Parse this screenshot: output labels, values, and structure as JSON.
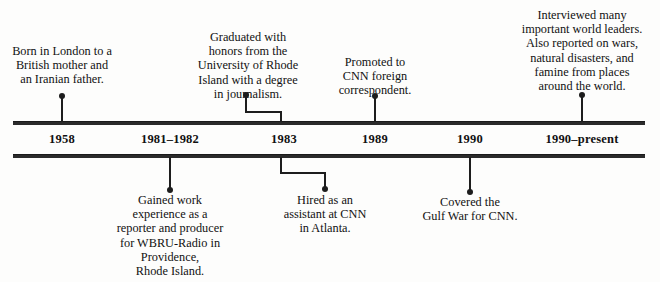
{
  "figure": {
    "type": "timeline",
    "orientation": "horizontal",
    "axis": {
      "line_color": "#2b2b2b",
      "style": "double-rule-band",
      "left_px": 13,
      "right_px": 645,
      "top_rule_y": 121,
      "bottom_rule_y": 154
    },
    "background_color": "#fdfdfc",
    "text_color": "#111111"
  },
  "years": [
    {
      "label": "1958",
      "x": 62
    },
    {
      "label": "1981–1982",
      "x": 170
    },
    {
      "label": "1983",
      "x": 284
    },
    {
      "label": "1989",
      "x": 375
    },
    {
      "label": "1990",
      "x": 470
    },
    {
      "label": "1990–present",
      "x": 582
    }
  ],
  "events": [
    {
      "id": "born",
      "year": "1958",
      "side": "above",
      "text": "Born in London to a\nBritish mother and\nan Iranian father.",
      "caption_x": 62,
      "caption_top": 44,
      "caption_width": 124,
      "dot_x": 62,
      "dot_y": 96,
      "connector": "straight"
    },
    {
      "id": "graduated",
      "year": "1983",
      "side": "above",
      "text": "Graduated with\nhonors from the\nUniversity of Rhode\nIsland with a degree\nin journalism.",
      "caption_x": 248,
      "caption_top": 30,
      "caption_width": 132,
      "dot_x": 246,
      "dot_y": 95,
      "connector": "elbow-right"
    },
    {
      "id": "promoted",
      "year": "1989",
      "side": "above",
      "text": "Promoted to\nCNN foreign\ncorrespondent.",
      "caption_x": 375,
      "caption_top": 55,
      "caption_width": 104,
      "dot_x": 375,
      "dot_y": 96,
      "connector": "straight"
    },
    {
      "id": "interviewed",
      "year": "1990–present",
      "side": "above",
      "text": "Interviewed many\nimportant world leaders.\nAlso reported on wars,\nnatural disasters, and\nfamine from places\naround the world.",
      "caption_x": 582,
      "caption_top": 8,
      "caption_width": 152,
      "dot_x": 582,
      "dot_y": 95,
      "connector": "straight"
    },
    {
      "id": "work-experience",
      "year": "1981–1982",
      "side": "below",
      "text": "Gained work\nexperience as a\nreporter and producer\nfor WBRU-Radio in\nProvidence,\nRhode Island.",
      "caption_x": 170,
      "caption_top": 193,
      "caption_width": 138,
      "dot_x": 170,
      "dot_y": 190,
      "connector": "straight"
    },
    {
      "id": "hired-cnn",
      "year": "1983",
      "side": "below",
      "text": "Hired as an\nassistant at CNN\nin Atlanta.",
      "caption_x": 325,
      "caption_top": 193,
      "caption_width": 112,
      "dot_x": 325,
      "dot_y": 189,
      "connector": "elbow-right"
    },
    {
      "id": "gulf-war",
      "year": "1990",
      "side": "below",
      "text": "Covered the\nGulf War for CNN.",
      "caption_x": 470,
      "caption_top": 195,
      "caption_width": 120,
      "dot_x": 470,
      "dot_y": 192,
      "connector": "straight"
    }
  ],
  "connector_geometry": {
    "graduated": {
      "dot_x": 246,
      "dot_y": 95,
      "drop_to_y": 112,
      "turn_to_x": 281,
      "end_y": 121
    },
    "hired-cnn": {
      "start_x": 281,
      "start_y": 157,
      "drop_to_y": 173,
      "turn_to_x": 325,
      "end_y": 189
    }
  }
}
